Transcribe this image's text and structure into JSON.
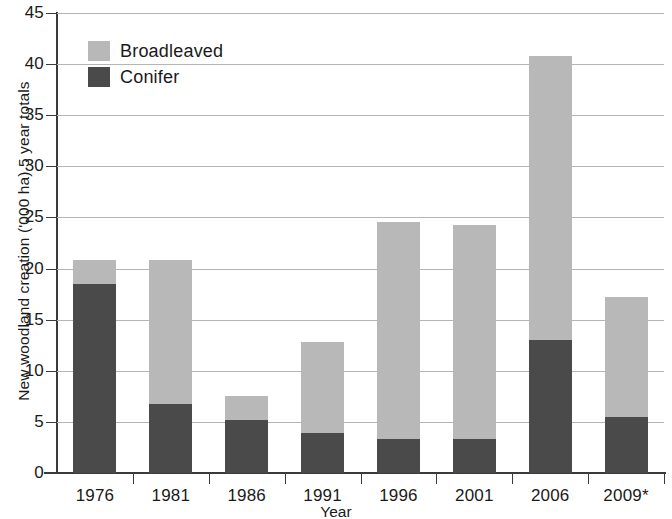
{
  "chart_data": {
    "type": "bar",
    "subtype": "stacked-vertical",
    "title": "",
    "xlabel": "Year",
    "ylabel": "New woodland creation ('000 ha) 5 year totals",
    "categories": [
      "1976",
      "1981",
      "1986",
      "1991",
      "1996",
      "2001",
      "2006",
      "2009*"
    ],
    "series": [
      {
        "name": "Conifer",
        "color": "#4a4a4a",
        "values": [
          18.5,
          6.8,
          5.2,
          3.9,
          3.3,
          3.3,
          13.0,
          5.5
        ]
      },
      {
        "name": "Broadleaved",
        "color": "#b8b8b8",
        "values": [
          2.3,
          14.0,
          2.3,
          8.9,
          21.3,
          21.0,
          27.8,
          11.7
        ]
      }
    ],
    "totals": [
      20.8,
      20.8,
      7.5,
      12.8,
      24.6,
      24.3,
      40.8,
      17.2
    ],
    "ylim": [
      0,
      45
    ],
    "yticks": [
      0,
      5,
      10,
      15,
      20,
      25,
      30,
      35,
      40,
      45
    ],
    "ytick_labels": [
      "0",
      "5",
      "10",
      "15",
      "20",
      "25",
      "30",
      "35",
      "40",
      "45"
    ],
    "grid": true,
    "grid_axis": "y",
    "legend_position": "top-left",
    "legend_order": [
      "Broadleaved",
      "Conifer"
    ],
    "footnote_marker": "*"
  },
  "legend": {
    "items": [
      {
        "label": "Broadleaved",
        "color": "#b8b8b8",
        "swatch_name": "legend-swatch-broadleaved"
      },
      {
        "label": "Conifer",
        "color": "#4a4a4a",
        "swatch_name": "legend-swatch-conifer"
      }
    ]
  },
  "axes": {
    "x_title": "Year",
    "y_title": "New woodland creation ('000 ha) 5 year totals"
  },
  "colors": {
    "broadleaved": "#b8b8b8",
    "conifer": "#4a4a4a",
    "axis": "#3a3a3a",
    "grid": "#b5b5b5",
    "background": "#ffffff",
    "text": "#1a1a1a"
  }
}
